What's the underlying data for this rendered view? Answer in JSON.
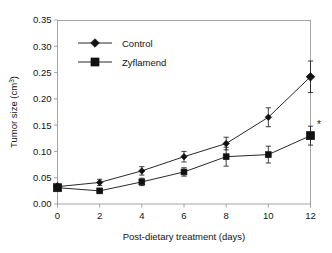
{
  "chart_data": {
    "type": "line",
    "title": "",
    "xlabel": "Post-dietary treatment (days)",
    "ylabel": "Tumor size (cm³)",
    "ylabel_base": "Tumor size (cm",
    "ylabel_sup": "3",
    "ylabel_close": ")",
    "x": [
      0,
      2,
      4,
      6,
      8,
      10,
      12
    ],
    "xlim": [
      0,
      12
    ],
    "ylim": [
      0.0,
      0.35
    ],
    "xticks": [
      0,
      2,
      4,
      6,
      8,
      10,
      12
    ],
    "xtick_labels": [
      "0",
      "2",
      "4",
      "6",
      "8",
      "10",
      "12"
    ],
    "yticks": [
      0.0,
      0.05,
      0.1,
      0.15,
      0.2,
      0.25,
      0.3,
      0.35
    ],
    "ytick_labels": [
      "0.00",
      "0.05",
      "0.10",
      "0.15",
      "0.20",
      "0.25",
      "0.30",
      "0.35"
    ],
    "grid": false,
    "legend_position": "upper-left-inside",
    "series": [
      {
        "name": "Control",
        "marker": "diamond",
        "linestyle": "solid",
        "color": "#111111",
        "values": [
          0.033,
          0.041,
          0.063,
          0.09,
          0.115,
          0.165,
          0.242
        ],
        "errors": [
          0.004,
          0.006,
          0.008,
          0.01,
          0.012,
          0.018,
          0.03
        ]
      },
      {
        "name": "Zyflamend",
        "marker": "square",
        "linestyle": "dotted",
        "color": "#111111",
        "values": [
          0.031,
          0.025,
          0.042,
          0.061,
          0.09,
          0.094,
          0.13
        ],
        "errors": [
          0.005,
          0.004,
          0.007,
          0.008,
          0.018,
          0.016,
          0.018
        ]
      }
    ],
    "annotations": [
      {
        "text": "*",
        "x": 12,
        "y": 0.152,
        "note": "significance marker beside day-12 Zyflamend point"
      }
    ]
  },
  "legend": {
    "items": [
      {
        "label": "Control",
        "marker": "diamond-marker",
        "line": "solid"
      },
      {
        "label": "Zyflamend",
        "marker": "square-marker",
        "line": "dotted"
      }
    ]
  }
}
